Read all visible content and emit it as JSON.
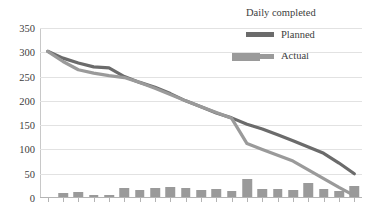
{
  "chart_data": {
    "type": "bar",
    "title": "",
    "xlabel": "",
    "ylabel": "",
    "ylim": [
      0,
      350
    ],
    "ytick_step": 50,
    "yticks": [
      0,
      50,
      100,
      150,
      200,
      250,
      300,
      350
    ],
    "grid": true,
    "legend_position": "top-right",
    "categories": [
      "0",
      "1",
      "2",
      "3",
      "4",
      "5",
      "6",
      "7",
      "8",
      "9",
      "10",
      "11",
      "12",
      "13",
      "14",
      "15",
      "16",
      "17",
      "18",
      "19",
      "20"
    ],
    "series": [
      {
        "name": "Daily completed",
        "type": "bar",
        "color": "#9a9a9a",
        "values": [
          0,
          9,
          10,
          5,
          4,
          19,
          14,
          18,
          20,
          19,
          15,
          17,
          13,
          37,
          16,
          16,
          15,
          28,
          16,
          12,
          22
        ]
      },
      {
        "name": "Planned",
        "type": "line",
        "color": "#6b6b6b",
        "values": [
          302,
          288,
          278,
          270,
          268,
          250,
          238,
          228,
          215,
          200,
          188,
          175,
          165,
          152,
          142,
          130,
          118,
          105,
          92,
          72,
          50
        ]
      },
      {
        "name": "Actual",
        "type": "line",
        "color": "#9a9a9a",
        "values": [
          302,
          281,
          264,
          257,
          252,
          248,
          238,
          226,
          213,
          200,
          188,
          176,
          164,
          112,
          100,
          88,
          76,
          58,
          40,
          22,
          5
        ]
      }
    ]
  },
  "legend": {
    "items": [
      {
        "label": "Daily completed",
        "swatch": "bar-swatch"
      },
      {
        "label": "Planned",
        "swatch": "line-swatch"
      },
      {
        "label": "Actual",
        "swatch": "line-swatch"
      }
    ]
  }
}
